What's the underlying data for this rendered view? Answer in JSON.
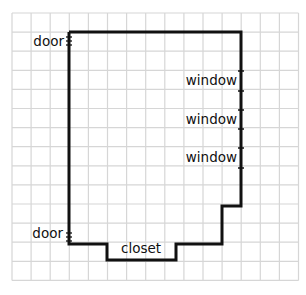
{
  "diagram": {
    "type": "floor-plan",
    "grid": {
      "cols": 15,
      "rows": 14,
      "origin_x": 12,
      "origin_y": 13,
      "cell": 19.1,
      "line_color": "#d6d6d6"
    },
    "wall_color": "#111111",
    "outline_grid_points": [
      [
        3,
        1
      ],
      [
        12,
        1
      ],
      [
        12,
        10
      ],
      [
        11,
        10
      ],
      [
        11,
        12
      ],
      [
        8.5,
        12
      ],
      [
        8.5,
        12.9
      ],
      [
        5,
        12.9
      ],
      [
        5,
        12
      ],
      [
        3,
        12
      ]
    ],
    "labels": {
      "door_top": "door",
      "door_bottom": "door",
      "window_1": "window",
      "window_2": "window",
      "window_3": "window",
      "closet": "closet"
    }
  }
}
